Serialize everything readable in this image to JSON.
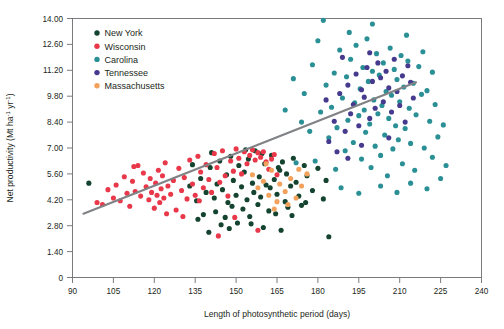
{
  "chart_data": {
    "type": "scatter",
    "title": "",
    "xlabel": "Length of photosynthetic period (days)",
    "ylabel": "Net productivity (Mt ha⁻¹ yr⁻¹)",
    "ylabel_parts": {
      "pre": "Net productivity (Mt ha",
      "sup1": "-1",
      "mid": " yr",
      "sup2": "-1",
      "post": ")"
    },
    "xlim": [
      90,
      240
    ],
    "ylim": [
      0,
      14
    ],
    "xticks": [
      90,
      105,
      120,
      135,
      150,
      165,
      180,
      195,
      210,
      225,
      240
    ],
    "xtick_labels": [
      "90",
      "105",
      "120",
      "135",
      "150",
      "165",
      "180",
      "195",
      "210",
      "225",
      "240"
    ],
    "yticks": [
      0,
      1.4,
      2.8,
      4.2,
      5.6,
      7.0,
      8.4,
      9.8,
      11.2,
      12.6,
      14.0
    ],
    "ytick_labels": [
      "0",
      "1.40",
      "2.80",
      "4.20",
      "5.60",
      "7.00",
      "8.40",
      "9.80",
      "11.20",
      "12.60",
      "14.00"
    ],
    "grid": false,
    "legend_position": "top-left",
    "trendline": {
      "x0": 94,
      "y0": 3.45,
      "x1": 216,
      "y1": 10.55,
      "color": "#808285"
    },
    "series": [
      {
        "name": "New York",
        "color": "#14432f",
        "points": [
          [
            135.5,
            4.15
          ],
          [
            137,
            5.35
          ],
          [
            138,
            3.4
          ],
          [
            139,
            4.6
          ],
          [
            140,
            2.45
          ],
          [
            140.5,
            5.95
          ],
          [
            142,
            4.3
          ],
          [
            142.5,
            3.55
          ],
          [
            143,
            5.05
          ],
          [
            144,
            6.3
          ],
          [
            145,
            4.75
          ],
          [
            146,
            3.25
          ],
          [
            146.5,
            5.55
          ],
          [
            147,
            4.05
          ],
          [
            148,
            6.55
          ],
          [
            148.5,
            3.85
          ],
          [
            149,
            5.25
          ],
          [
            150,
            4.45
          ],
          [
            150.5,
            2.95
          ],
          [
            151,
            6.05
          ],
          [
            152,
            4.9
          ],
          [
            152.5,
            3.7
          ],
          [
            153,
            5.7
          ],
          [
            154,
            4.2
          ],
          [
            154.5,
            6.4
          ],
          [
            155,
            3.3
          ],
          [
            156,
            5.1
          ],
          [
            156.5,
            4.6
          ],
          [
            157,
            6.85
          ],
          [
            158,
            3.95
          ],
          [
            158.5,
            5.45
          ],
          [
            159,
            4.35
          ],
          [
            160,
            2.7
          ],
          [
            160.5,
            6.15
          ],
          [
            161,
            5.0
          ],
          [
            162,
            3.6
          ],
          [
            162.5,
            4.85
          ],
          [
            163,
            6.6
          ],
          [
            164,
            5.3
          ],
          [
            164.5,
            3.45
          ],
          [
            165,
            4.5
          ],
          [
            166,
            5.8
          ],
          [
            166.5,
            2.55
          ],
          [
            167,
            6.25
          ],
          [
            168,
            4.1
          ],
          [
            168.5,
            5.6
          ],
          [
            169,
            3.8
          ],
          [
            170,
            4.95
          ],
          [
            171,
            6.45
          ],
          [
            172,
            5.15
          ],
          [
            173,
            4.4
          ],
          [
            174,
            3.9
          ],
          [
            176,
            5.5
          ],
          [
            178,
            4.7
          ],
          [
            180,
            5.9
          ],
          [
            182,
            4.25
          ],
          [
            133,
            4.95
          ],
          [
            134,
            6.1
          ],
          [
            136,
            3.15
          ],
          [
            141,
            6.75
          ],
          [
            144.5,
            2.85
          ],
          [
            153.5,
            6.9
          ],
          [
            159.5,
            6.7
          ],
          [
            165.5,
            5.95
          ],
          [
            170.5,
            3.35
          ],
          [
            175,
            6.05
          ],
          [
            147.5,
            2.65
          ],
          [
            155.5,
            2.9
          ],
          [
            175.5,
            4.05
          ],
          [
            183,
            5.25
          ],
          [
            96,
            5.1
          ],
          [
            184,
            2.2
          ]
        ]
      },
      {
        "name": "Wisconsin",
        "color": "#e8384a",
        "points": [
          [
            99,
            4.05
          ],
          [
            101,
            3.95
          ],
          [
            103,
            4.75
          ],
          [
            105,
            4.3
          ],
          [
            106,
            5.0
          ],
          [
            107.5,
            4.15
          ],
          [
            109,
            5.45
          ],
          [
            110,
            4.55
          ],
          [
            111,
            3.85
          ],
          [
            112,
            5.2
          ],
          [
            113,
            4.65
          ],
          [
            114,
            6.05
          ],
          [
            115,
            4.4
          ],
          [
            116,
            5.65
          ],
          [
            117,
            4.9
          ],
          [
            118,
            4.2
          ],
          [
            118.5,
            5.35
          ],
          [
            119,
            4.6
          ],
          [
            120,
            3.75
          ],
          [
            120.5,
            5.1
          ],
          [
            121,
            4.45
          ],
          [
            121.5,
            5.8
          ],
          [
            122,
            4.05
          ],
          [
            122.5,
            4.8
          ],
          [
            123,
            5.5
          ],
          [
            123.5,
            4.3
          ],
          [
            124,
            6.2
          ],
          [
            125,
            4.95
          ],
          [
            126,
            4.5
          ],
          [
            127,
            5.25
          ],
          [
            128,
            3.65
          ],
          [
            129,
            5.9
          ],
          [
            130,
            4.7
          ],
          [
            131,
            5.4
          ],
          [
            132,
            4.25
          ],
          [
            133,
            6.35
          ],
          [
            134,
            5.05
          ],
          [
            135,
            4.45
          ],
          [
            136,
            6.55
          ],
          [
            137,
            5.7
          ],
          [
            138,
            4.85
          ],
          [
            139,
            6.1
          ],
          [
            140,
            5.3
          ],
          [
            141,
            4.6
          ],
          [
            142,
            6.7
          ],
          [
            143,
            5.95
          ],
          [
            144,
            5.15
          ],
          [
            145,
            6.85
          ],
          [
            146,
            5.5
          ],
          [
            147,
            4.4
          ],
          [
            148,
            6.3
          ],
          [
            149,
            5.75
          ],
          [
            150,
            6.95
          ],
          [
            151,
            6.45
          ],
          [
            152,
            5.6
          ],
          [
            153,
            6.8
          ],
          [
            154,
            6.15
          ],
          [
            155,
            6.6
          ],
          [
            156,
            6.9
          ],
          [
            157,
            6.35
          ],
          [
            158,
            6.75
          ],
          [
            159,
            6.5
          ],
          [
            160,
            6.8
          ],
          [
            161,
            6.25
          ],
          [
            162,
            5.85
          ],
          [
            163,
            6.4
          ],
          [
            164,
            6.65
          ],
          [
            165,
            5.55
          ],
          [
            112.5,
            6.0
          ],
          [
            124.5,
            3.45
          ],
          [
            130.5,
            3.3
          ],
          [
            143.5,
            2.25
          ],
          [
            158,
            2.55
          ],
          [
            149.5,
            3.25
          ],
          [
            136.5,
            4.15
          ]
        ]
      },
      {
        "name": "Carolina",
        "color": "#2a9095",
        "points": [
          [
            172,
            6.2
          ],
          [
            175,
            9.95
          ],
          [
            178,
            11.5
          ],
          [
            180,
            12.8
          ],
          [
            181,
            8.95
          ],
          [
            182,
            13.9
          ],
          [
            183,
            10.4
          ],
          [
            184,
            7.55
          ],
          [
            185,
            9.2
          ],
          [
            186,
            11.05
          ],
          [
            187,
            8.1
          ],
          [
            188,
            12.3
          ],
          [
            189,
            9.7
          ],
          [
            190,
            6.85
          ],
          [
            190.5,
            10.85
          ],
          [
            191,
            8.5
          ],
          [
            192,
            11.8
          ],
          [
            193,
            7.3
          ],
          [
            193.5,
            9.45
          ],
          [
            194,
            12.55
          ],
          [
            195,
            8.75
          ],
          [
            195.5,
            10.2
          ],
          [
            196,
            6.4
          ],
          [
            196.5,
            11.35
          ],
          [
            197,
            9.05
          ],
          [
            197.5,
            7.85
          ],
          [
            198,
            12.9
          ],
          [
            198.5,
            10.6
          ],
          [
            199,
            8.3
          ],
          [
            199.5,
            5.95
          ],
          [
            200,
            11.15
          ],
          [
            200.5,
            9.6
          ],
          [
            201,
            7.1
          ],
          [
            201.5,
            12.1
          ],
          [
            202,
            8.85
          ],
          [
            202.5,
            10.95
          ],
          [
            203,
            6.6
          ],
          [
            203.5,
            9.3
          ],
          [
            204,
            11.6
          ],
          [
            204.5,
            7.7
          ],
          [
            205,
            10.05
          ],
          [
            205.5,
            5.5
          ],
          [
            206,
            8.6
          ],
          [
            206.5,
            12.4
          ],
          [
            207,
            9.85
          ],
          [
            207.5,
            6.95
          ],
          [
            208,
            11.25
          ],
          [
            208.5,
            8.2
          ],
          [
            209,
            10.7
          ],
          [
            209.5,
            7.45
          ],
          [
            210,
            9.5
          ],
          [
            210.5,
            12.0
          ],
          [
            211,
            6.15
          ],
          [
            211.5,
            10.3
          ],
          [
            212,
            8.05
          ],
          [
            213,
            11.7
          ],
          [
            213.5,
            9.15
          ],
          [
            214,
            7.25
          ],
          [
            215,
            10.5
          ],
          [
            215.5,
            5.8
          ],
          [
            216,
            8.8
          ],
          [
            217,
            11.4
          ],
          [
            218,
            9.9
          ],
          [
            219,
            7.0
          ],
          [
            220,
            10.1
          ],
          [
            221,
            8.45
          ],
          [
            222,
            6.5
          ],
          [
            223,
            9.35
          ],
          [
            224,
            7.6
          ],
          [
            225,
            5.35
          ],
          [
            226,
            8.25
          ],
          [
            227,
            6.05
          ],
          [
            177,
            7.9
          ],
          [
            186.5,
            5.85
          ],
          [
            191.5,
            13.25
          ],
          [
            200,
            13.7
          ],
          [
            212.5,
            13.1
          ],
          [
            218.5,
            12.2
          ],
          [
            203,
            4.95
          ],
          [
            209,
            4.6
          ],
          [
            214,
            5.1
          ],
          [
            220,
            4.8
          ],
          [
            168,
            9.05
          ],
          [
            171,
            10.75
          ],
          [
            174,
            8.4
          ],
          [
            179,
            6.3
          ],
          [
            188.5,
            4.85
          ],
          [
            195,
            4.55
          ],
          [
            222,
            11.1
          ]
        ]
      },
      {
        "name": "Tennessee",
        "color": "#453a8e",
        "points": [
          [
            183,
            9.6
          ],
          [
            186,
            8.45
          ],
          [
            188,
            9.95
          ],
          [
            190,
            7.9
          ],
          [
            191,
            10.4
          ],
          [
            192,
            8.85
          ],
          [
            193,
            9.35
          ],
          [
            194,
            11.0
          ],
          [
            195,
            8.2
          ],
          [
            196,
            10.15
          ],
          [
            197,
            9.75
          ],
          [
            198,
            11.35
          ],
          [
            199,
            8.6
          ],
          [
            200,
            10.6
          ],
          [
            201,
            9.15
          ],
          [
            202,
            11.6
          ],
          [
            203,
            10.8
          ],
          [
            204,
            9.5
          ],
          [
            205,
            11.15
          ],
          [
            206,
            10.25
          ],
          [
            207,
            8.95
          ],
          [
            208,
            11.8
          ],
          [
            209,
            10.05
          ],
          [
            210,
            9.3
          ],
          [
            211,
            10.9
          ],
          [
            212,
            8.4
          ],
          [
            213,
            11.45
          ],
          [
            214,
            10.55
          ],
          [
            184,
            7.35
          ],
          [
            187,
            6.8
          ],
          [
            189,
            11.9
          ],
          [
            196,
            7.15
          ],
          [
            206,
            7.55
          ],
          [
            215,
            9.7
          ],
          [
            199,
            12.15
          ],
          [
            191,
            6.45
          ]
        ]
      },
      {
        "name": "Massachusetts",
        "color": "#f2a25c",
        "points": [
          [
            156,
            5.55
          ],
          [
            158,
            4.85
          ],
          [
            160,
            5.2
          ],
          [
            162,
            4.45
          ],
          [
            163,
            5.8
          ],
          [
            165,
            4.1
          ],
          [
            166,
            5.05
          ],
          [
            168,
            4.65
          ],
          [
            170,
            5.35
          ],
          [
            172,
            4.3
          ],
          [
            174,
            4.95
          ],
          [
            176,
            5.6
          ],
          [
            161,
            6.15
          ],
          [
            169,
            3.95
          ],
          [
            164,
            3.7
          ],
          [
            173,
            5.85
          ]
        ]
      }
    ]
  },
  "legend": {
    "entries": [
      {
        "label": "New York",
        "color": "#14432f"
      },
      {
        "label": "Wisconsin",
        "color": "#e8384a"
      },
      {
        "label": "Carolina",
        "color": "#2a9095"
      },
      {
        "label": "Tennessee",
        "color": "#453a8e"
      },
      {
        "label": "Massachusetts",
        "color": "#f2a25c"
      }
    ]
  },
  "axes": {
    "x_title": "Length of photosynthetic period (days)",
    "y_title_pre": "Net productivity (Mt ha",
    "y_title_sup1": "-1",
    "y_title_mid": " yr",
    "y_title_sup2": "-1",
    "y_title_post": ")"
  }
}
